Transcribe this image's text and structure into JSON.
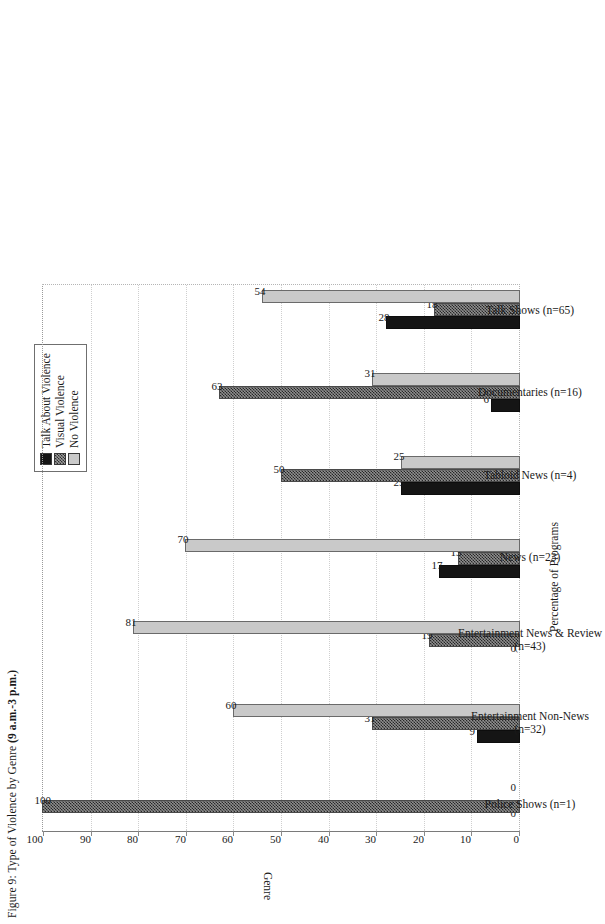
{
  "figure": {
    "title_prefix": "Figure 9: Type of Violence by Genre ",
    "title_emphasis": "(9 a.m.-3 p.m.)"
  },
  "legend": {
    "items": [
      {
        "label": "Talk About Violence",
        "swatch": "black-solid-swatch",
        "color": "#151515"
      },
      {
        "label": "Visual Violence",
        "swatch": "checkered-gray-swatch",
        "color": "#8f8f8f"
      },
      {
        "label": "No Violence",
        "swatch": "light-gray-swatch",
        "color": "#c9c9c9"
      }
    ]
  },
  "axes": {
    "value_axis_title": "Percentage of Programs",
    "category_axis_title": "Genre",
    "ticks": [
      "0",
      "10",
      "20",
      "30",
      "40",
      "50",
      "60",
      "70",
      "80",
      "90",
      "100"
    ]
  },
  "chart_data": {
    "type": "bar",
    "title": "Figure 9: Type of Violence by Genre (9 a.m.-3 p.m.)",
    "orientation": "vertical-grouped",
    "xlabel": "Genre",
    "ylabel": "Percentage of Programs",
    "ylim": [
      0,
      100
    ],
    "ytick_step": 10,
    "grid": true,
    "legend_position": "top-right",
    "categories": [
      "Police Shows (n=1)",
      "Entertainment Non-News\n(n=32)",
      "Entertainment News & Review\n(n=43)",
      "News (n=23)",
      "Tabloid News (n=4)",
      "Documentaries (n=16)",
      "Talk Shows (n=65)"
    ],
    "series": [
      {
        "name": "Talk About Violence",
        "color": "#151515",
        "values": [
          0,
          9,
          0,
          17,
          25,
          6,
          28
        ]
      },
      {
        "name": "Visual Violence",
        "color": "#8f8f8f",
        "values": [
          100,
          31,
          19,
          13,
          50,
          63,
          18
        ]
      },
      {
        "name": "No Violence",
        "color": "#c9c9c9",
        "values": [
          0,
          60,
          81,
          70,
          25,
          31,
          54
        ]
      }
    ]
  }
}
